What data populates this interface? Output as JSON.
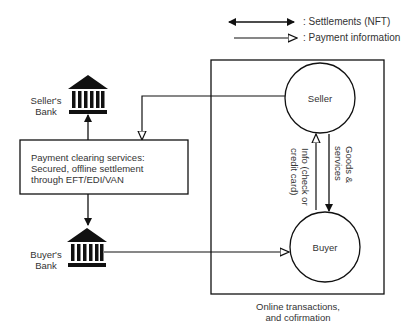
{
  "legend": {
    "settlements": ": Settlements (NFT)",
    "payment_info": ": Payment information"
  },
  "nodes": {
    "seller_bank": {
      "line1": "Seller's",
      "line2": "Bank"
    },
    "buyer_bank": {
      "line1": "Buyer's",
      "line2": "Bank"
    },
    "clearing": {
      "line1": "Payment clearing services:",
      "line2": "Secured, offline settlement",
      "line3": "through EFT/EDI/VAN"
    },
    "seller": "Seller",
    "buyer": "Buyer"
  },
  "edges": {
    "goods": {
      "line1": "Goods &",
      "line2": "services"
    },
    "info": {
      "line1": "Info (check or",
      "line2": "credit card)"
    }
  },
  "caption": {
    "line1": "Online transactions,",
    "line2": "and cofirmation"
  },
  "colors": {
    "stroke": "#111111",
    "text": "#333333",
    "background": "#ffffff"
  }
}
